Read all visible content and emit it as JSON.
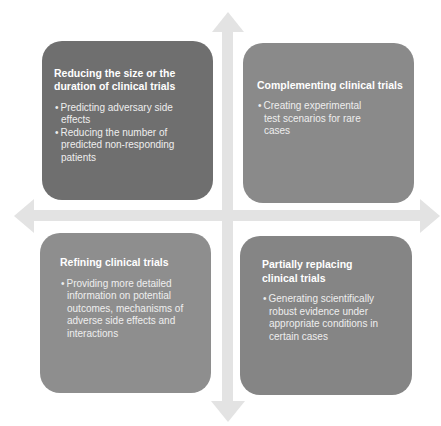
{
  "colors": {
    "arrow": "#e3e3e3",
    "box_top_left": "#6f6f6f",
    "box_top_right": "#8a8a8a",
    "box_bottom_left": "#8e8e8e",
    "box_bottom_right": "#858585",
    "text": "#ffffff"
  },
  "quadrants": {
    "top_left": {
      "title": "Reducing the size or the duration of clinical trials",
      "bullets": [
        "Predicting adversary side effects",
        "Reducing the number of predicted non-responding patients"
      ]
    },
    "top_right": {
      "title": "Complementing clinical trials",
      "bullets": [
        "Creating experimental test scenarios for rare cases"
      ]
    },
    "bottom_left": {
      "title": "Refining clinical trials",
      "bullets": [
        "Providing more detailed information on potential outcomes, mechanisms of adverse side effects and interactions"
      ]
    },
    "bottom_right": {
      "title": "Partially replacing clinical trials",
      "bullets": [
        "Generating scientifically robust evidence under appropriate conditions in certain cases"
      ]
    }
  },
  "axes": {
    "icons": [
      "arrow-up-icon",
      "arrow-down-icon",
      "arrow-left-icon",
      "arrow-right-icon"
    ]
  }
}
